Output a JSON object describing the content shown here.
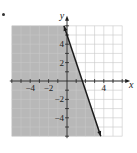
{
  "marker": "•",
  "chart_data": {
    "type": "line",
    "title": "",
    "xlabel": "x",
    "ylabel": "y",
    "xlim": [
      -6,
      6
    ],
    "ylim": [
      -6,
      6
    ],
    "grid": true,
    "x_tick_labels": [
      {
        "value": -4,
        "label": "−4"
      },
      {
        "value": -2,
        "label": "−2"
      },
      {
        "value": 4,
        "label": "4"
      }
    ],
    "y_tick_labels": [
      {
        "value": 4,
        "label": "4"
      },
      {
        "value": 2,
        "label": "2"
      },
      {
        "value": -2,
        "label": "−2"
      },
      {
        "value": -4,
        "label": "−4"
      }
    ],
    "series": [
      {
        "name": "boundary",
        "equation": "y = -3x + 5",
        "style": "solid",
        "x": [
          -0.33,
          3.67
        ],
        "y": [
          6,
          -6
        ]
      }
    ],
    "shaded_region": "left of line (3x + y <= 5)",
    "colors": {
      "shade": "#b8b8b8",
      "grid": "#c8c8c8",
      "line": "#1a1a1a",
      "background": "#ffffff"
    }
  }
}
